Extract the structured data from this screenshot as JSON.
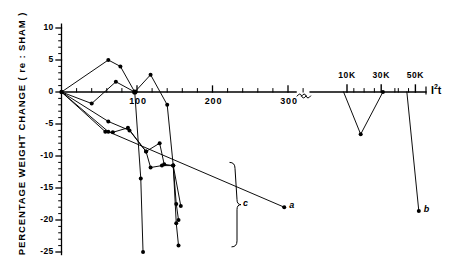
{
  "chart_data": {
    "type": "line",
    "title": "",
    "xlabel": "I²t",
    "ylabel": "PERCENTAGE  WEIGHT  CHANGE  ( re : SHAM )",
    "ylim": [
      -25,
      10
    ],
    "xlim": [
      0,
      380
    ],
    "grid": false,
    "legend_position": "inline-annotations",
    "y_ticks": [
      10,
      5,
      0,
      -5,
      -10,
      -15,
      -20,
      -25
    ],
    "y_tick_labels": [
      "10",
      "5",
      "0",
      "-5",
      "-10",
      "-15",
      "-20",
      "-25"
    ],
    "y_minor_step": 1,
    "x_ticks_main": [
      0,
      20,
      40,
      60,
      80,
      100,
      120,
      140,
      160,
      180,
      200,
      220,
      240,
      260,
      280,
      300,
      320
    ],
    "x_tick_labels_main": [
      "",
      "",
      "",
      "",
      "",
      "100",
      "",
      "",
      "",
      "",
      "200",
      "",
      "",
      "",
      "",
      "300",
      ""
    ],
    "axis_break": {
      "present": true,
      "symbol": "≈",
      "after_x": 320
    },
    "x_ticks_break": [
      10000,
      20000,
      30000,
      40000,
      50000,
      60000
    ],
    "x_tick_labels_break": [
      "10K",
      "",
      "30K",
      "",
      "50K",
      ""
    ],
    "series": [
      {
        "name": "upper-peak-trace",
        "points": [
          {
            "x": 0,
            "y": 0
          },
          {
            "x": 62,
            "y": 5.0
          },
          {
            "x": 78,
            "y": 4.0
          },
          {
            "x": 97,
            "y": 0.0
          },
          {
            "x": 105,
            "y": -13.5
          },
          {
            "x": 108,
            "y": -25.0
          }
        ]
      },
      {
        "name": "second-peak-trace",
        "points": [
          {
            "x": 0,
            "y": 0
          },
          {
            "x": 40,
            "y": -1.8
          },
          {
            "x": 72,
            "y": 1.6
          },
          {
            "x": 97,
            "y": 0.0
          },
          {
            "x": 118,
            "y": 2.7
          },
          {
            "x": 140,
            "y": -2.0
          },
          {
            "x": 148,
            "y": -11.5
          },
          {
            "x": 152,
            "y": -20.5
          },
          {
            "x": 155,
            "y": -24.0
          }
        ]
      },
      {
        "name": "mid-descent-trace",
        "points": [
          {
            "x": 0,
            "y": 0
          },
          {
            "x": 62,
            "y": -4.6
          },
          {
            "x": 90,
            "y": -6.0
          },
          {
            "x": 112,
            "y": -9.3
          },
          {
            "x": 130,
            "y": -8.0
          },
          {
            "x": 136,
            "y": -11.3
          },
          {
            "x": 148,
            "y": -11.5
          },
          {
            "x": 152,
            "y": -17.5
          },
          {
            "x": 155,
            "y": -20.0
          }
        ]
      },
      {
        "name": "lower-flat-trace",
        "points": [
          {
            "x": 0,
            "y": 0
          },
          {
            "x": 58,
            "y": -6.2
          },
          {
            "x": 68,
            "y": -6.3
          },
          {
            "x": 88,
            "y": -5.6
          },
          {
            "x": 112,
            "y": -9.3
          },
          {
            "x": 118,
            "y": -11.8
          },
          {
            "x": 133,
            "y": -11.5
          },
          {
            "x": 148,
            "y": -11.5
          },
          {
            "x": 158,
            "y": -17.8
          }
        ]
      },
      {
        "name": "trace-to-a",
        "points": [
          {
            "x": 0,
            "y": 0
          },
          {
            "x": 62,
            "y": -6.2
          },
          {
            "x": 295,
            "y": -18.0
          }
        ]
      },
      {
        "name": "high-energy-v-trace",
        "points": [
          {
            "x": 8000,
            "y": 0.0
          },
          {
            "x": 18000,
            "y": -6.6
          },
          {
            "x": 31000,
            "y": 0.0
          }
        ]
      },
      {
        "name": "trace-to-b",
        "points": [
          {
            "x": 45000,
            "y": 0.0
          },
          {
            "x": 52000,
            "y": -18.6
          }
        ]
      }
    ],
    "annotations": [
      {
        "label": "a",
        "x": 295,
        "y": -18.0,
        "note": "endpoint label a"
      },
      {
        "label": "b",
        "x": 52000,
        "y": -18.6,
        "note": "endpoint label b"
      },
      {
        "label": "c",
        "x": 180,
        "y": -16.0,
        "note": "brace grouping lower traces"
      }
    ]
  }
}
